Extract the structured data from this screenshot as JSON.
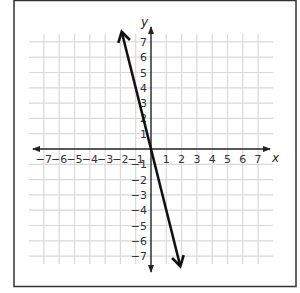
{
  "chart_data": {
    "type": "line",
    "title": "",
    "xlabel": "x",
    "ylabel": "y",
    "xlim": [
      -7,
      7
    ],
    "ylim": [
      -7,
      7
    ],
    "grid": true,
    "x_ticks": [
      -7,
      -6,
      -5,
      -4,
      -3,
      -2,
      -1,
      1,
      2,
      3,
      4,
      5,
      6,
      7
    ],
    "y_ticks": [
      -7,
      -6,
      -5,
      -4,
      -3,
      -2,
      -1,
      1,
      2,
      3,
      4,
      5,
      6,
      7
    ],
    "x_tick_labels": [
      "−7",
      "−6",
      "−5",
      "−4",
      "−3",
      "−2",
      "−1",
      "1",
      "2",
      "3",
      "4",
      "5",
      "6",
      "7"
    ],
    "y_tick_labels": [
      "−7",
      "−6",
      "−5",
      "−4",
      "−3",
      "−2",
      "−1",
      "1",
      "2",
      "3",
      "4",
      "5",
      "6",
      "7"
    ],
    "series": [
      {
        "name": "line",
        "equation": "y = -4x",
        "slope": -4,
        "intercept": 0,
        "x": [
          -1.9,
          -1,
          0,
          1,
          1.9
        ],
        "y": [
          7.6,
          4,
          0,
          -4,
          -7.6
        ],
        "arrows_both_ends": true
      }
    ],
    "legend": null
  },
  "colors": {
    "grid": "#d9d9d9",
    "axes": "#222222",
    "line": "#111111",
    "frame": "#333333",
    "background": "#ffffff"
  }
}
